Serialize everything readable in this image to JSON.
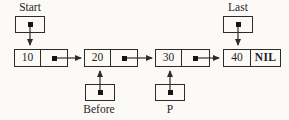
{
  "diagram": {
    "type": "singly-linked-list",
    "background_color": "#fbfaf6",
    "line_color": "#2e2c29",
    "text_color": "#1f1f1f",
    "pointers": {
      "start": "Start",
      "last": "Last",
      "before": "Before",
      "p": "P"
    },
    "nodes": [
      {
        "value": "10"
      },
      {
        "value": "20"
      },
      {
        "value": "30"
      },
      {
        "value": "40",
        "next_label": "NIL"
      }
    ]
  }
}
